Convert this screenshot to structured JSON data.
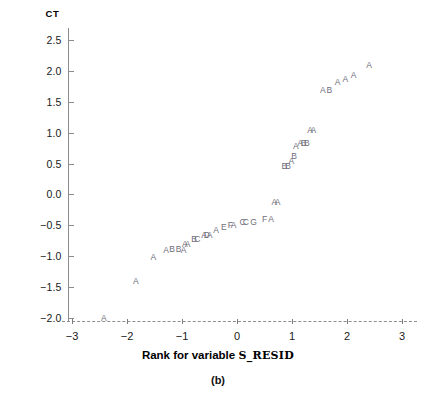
{
  "figure": {
    "caption": "(b)",
    "ylabel": "CT",
    "xlabel_prefix": "Rank for variable",
    "xlabel_variable": "S_RESID"
  },
  "chart_data": {
    "type": "scatter",
    "title": "",
    "subtitle": "",
    "caption": "(b)",
    "xlabel": "Rank for variable S_RESID",
    "ylabel": "CT",
    "xlim": [
      -3.2,
      3.2
    ],
    "ylim": [
      -2.15,
      2.75
    ],
    "xticks": [
      -3,
      -2,
      -1,
      0,
      1,
      2,
      3
    ],
    "xticklabels": [
      "−3",
      "−2",
      "−1",
      "0",
      "1",
      "2",
      "3"
    ],
    "yticks": [
      -2.0,
      -1.5,
      -1.0,
      -0.5,
      0.0,
      0.5,
      1.0,
      1.5,
      2.0,
      2.5
    ],
    "yticklabels": [
      "−2.0",
      "−1.5",
      "−1.0",
      "−0.5",
      "0.0",
      "0.5",
      "1.0",
      "1.5",
      "2.0",
      "2.5"
    ],
    "grid": false,
    "legend": null,
    "marker_style": "letter-codes",
    "marker_note": "Letters A-G encode number of coincident cases (A=1, B=2, C=3, ...)",
    "points": [
      {
        "x": -2.42,
        "y": -2.0,
        "label": "A"
      },
      {
        "x": -1.84,
        "y": -1.4,
        "label": "A"
      },
      {
        "x": -1.52,
        "y": -1.02,
        "label": "A"
      },
      {
        "x": -1.29,
        "y": -0.9,
        "label": "A"
      },
      {
        "x": -1.18,
        "y": -0.88,
        "label": "B"
      },
      {
        "x": -1.06,
        "y": -0.88,
        "label": "B"
      },
      {
        "x": -0.97,
        "y": -0.9,
        "label": "A"
      },
      {
        "x": -0.95,
        "y": -0.8,
        "label": "A"
      },
      {
        "x": -0.9,
        "y": -0.8,
        "label": "A"
      },
      {
        "x": -0.78,
        "y": -0.72,
        "label": "B"
      },
      {
        "x": -0.72,
        "y": -0.72,
        "label": "C"
      },
      {
        "x": -0.6,
        "y": -0.66,
        "label": "A"
      },
      {
        "x": -0.55,
        "y": -0.66,
        "label": "D"
      },
      {
        "x": -0.5,
        "y": -0.66,
        "label": "A"
      },
      {
        "x": -0.38,
        "y": -0.58,
        "label": "A"
      },
      {
        "x": -0.24,
        "y": -0.52,
        "label": "E"
      },
      {
        "x": -0.12,
        "y": -0.5,
        "label": "F"
      },
      {
        "x": -0.06,
        "y": -0.5,
        "label": "A"
      },
      {
        "x": 0.1,
        "y": -0.44,
        "label": "C"
      },
      {
        "x": 0.16,
        "y": -0.44,
        "label": "C"
      },
      {
        "x": 0.3,
        "y": -0.44,
        "label": "G"
      },
      {
        "x": 0.5,
        "y": -0.4,
        "label": "F"
      },
      {
        "x": 0.62,
        "y": -0.4,
        "label": "A"
      },
      {
        "x": 0.68,
        "y": -0.12,
        "label": "A"
      },
      {
        "x": 0.74,
        "y": -0.12,
        "label": "A"
      },
      {
        "x": 0.86,
        "y": 0.46,
        "label": "B"
      },
      {
        "x": 0.93,
        "y": 0.46,
        "label": "B"
      },
      {
        "x": 0.99,
        "y": 0.54,
        "label": "A"
      },
      {
        "x": 1.04,
        "y": 0.62,
        "label": "B"
      },
      {
        "x": 1.07,
        "y": 0.78,
        "label": "A"
      },
      {
        "x": 1.15,
        "y": 0.84,
        "label": "A"
      },
      {
        "x": 1.21,
        "y": 0.84,
        "label": "B"
      },
      {
        "x": 1.27,
        "y": 0.84,
        "label": "B"
      },
      {
        "x": 1.33,
        "y": 1.04,
        "label": "A"
      },
      {
        "x": 1.39,
        "y": 1.04,
        "label": "A"
      },
      {
        "x": 1.56,
        "y": 1.7,
        "label": "A"
      },
      {
        "x": 1.68,
        "y": 1.7,
        "label": "B"
      },
      {
        "x": 1.83,
        "y": 1.82,
        "label": "A"
      },
      {
        "x": 1.97,
        "y": 1.88,
        "label": "A"
      },
      {
        "x": 2.12,
        "y": 1.94,
        "label": "A"
      },
      {
        "x": 2.4,
        "y": 2.1,
        "label": "A"
      }
    ]
  }
}
